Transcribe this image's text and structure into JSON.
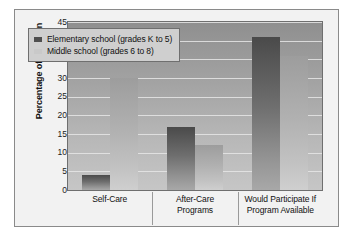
{
  "chart_data": {
    "type": "bar",
    "title": "",
    "subtitle": "",
    "xlabel": "",
    "ylabel": "Percentage of Children",
    "ylim": [
      0,
      45
    ],
    "yticks": [
      45,
      40,
      35,
      30,
      25,
      20,
      15,
      10,
      5,
      0
    ],
    "grid": true,
    "legend_position": "top-left-inside",
    "categories": [
      "Self-Care",
      "After-Care Programs",
      "Would Participate If Program Available"
    ],
    "category_lines": [
      [
        "Self-Care"
      ],
      [
        "After-Care",
        "Programs"
      ],
      [
        "Would Participate If",
        "Program Available"
      ]
    ],
    "series": [
      {
        "name": "Elementary school (grades K to 5)",
        "color": "#4f4f4f",
        "values": [
          4,
          17,
          41
        ]
      },
      {
        "name": "Middle school (grades 6 to 8)",
        "color": "#c9c9c9",
        "values": [
          30,
          12,
          36
        ]
      }
    ]
  },
  "figure": {
    "frame_color": "#8a8a8a",
    "background_color": "#f2f2f2",
    "plot_background_top": "#8f8f8f",
    "plot_background_bottom": "#c6c6c6",
    "gridline_color": "#e6e6e6"
  }
}
